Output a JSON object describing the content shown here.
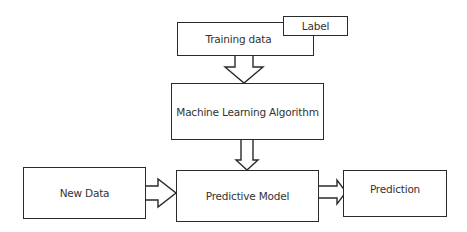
{
  "diagram": {
    "nodes": {
      "training_data": {
        "label": "Training data"
      },
      "label": {
        "label": "Label"
      },
      "ml_algorithm": {
        "label": "Machine Learning Algorithm"
      },
      "new_data": {
        "label": "New Data"
      },
      "predictive_model": {
        "label": "Predictive Model"
      },
      "prediction": {
        "label": "Prediction"
      }
    },
    "edges": [
      {
        "from": "training_data",
        "to": "ml_algorithm"
      },
      {
        "from": "ml_algorithm",
        "to": "predictive_model"
      },
      {
        "from": "new_data",
        "to": "predictive_model"
      },
      {
        "from": "predictive_model",
        "to": "prediction"
      }
    ]
  }
}
